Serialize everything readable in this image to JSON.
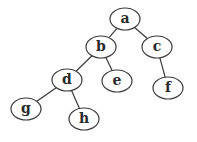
{
  "diagram": {
    "type": "binary-tree",
    "nodes": [
      {
        "id": "a",
        "label": "a"
      },
      {
        "id": "b",
        "label": "b"
      },
      {
        "id": "c",
        "label": "c"
      },
      {
        "id": "d",
        "label": "d"
      },
      {
        "id": "e",
        "label": "e"
      },
      {
        "id": "f",
        "label": "f"
      },
      {
        "id": "g",
        "label": "g"
      },
      {
        "id": "h",
        "label": "h"
      }
    ],
    "edges": [
      {
        "from": "a",
        "to": "b"
      },
      {
        "from": "a",
        "to": "c"
      },
      {
        "from": "b",
        "to": "d"
      },
      {
        "from": "b",
        "to": "e"
      },
      {
        "from": "c",
        "to": "f"
      },
      {
        "from": "d",
        "to": "g"
      },
      {
        "from": "d",
        "to": "h"
      }
    ]
  }
}
